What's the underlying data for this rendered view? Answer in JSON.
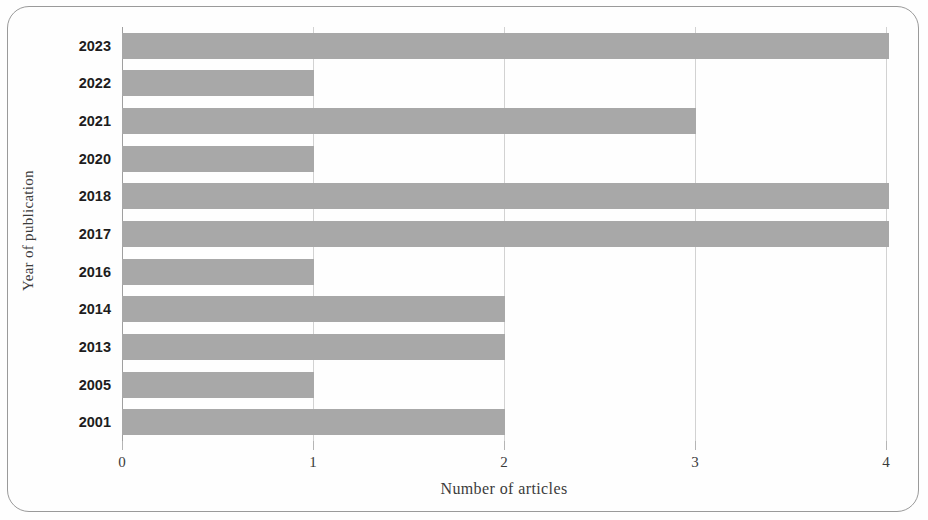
{
  "chart_data": {
    "type": "bar",
    "orientation": "horizontal",
    "title": "",
    "xlabel": "Number of articles",
    "ylabel": "Year of publication",
    "categories": [
      "2023",
      "2022",
      "2021",
      "2020",
      "2018",
      "2017",
      "2016",
      "2014",
      "2013",
      "2005",
      "2001"
    ],
    "values": [
      4,
      1,
      3,
      1,
      4,
      4,
      1,
      2,
      2,
      1,
      2
    ],
    "xlim": [
      0,
      4
    ],
    "xticks": [
      0,
      1,
      2,
      3,
      4
    ],
    "xtick_labels": [
      "0",
      "1",
      "2",
      "3",
      "4"
    ],
    "grid": true,
    "grid_axis": "x",
    "legend": null,
    "bar_color": "#a8a8a8",
    "gridline_color": "#d2d2d2",
    "axis_color": "#9f9f9f",
    "frame_color": "#9a9a9a",
    "text_color": "#3a3a3a",
    "category_label_color": "#1d1d1d"
  }
}
